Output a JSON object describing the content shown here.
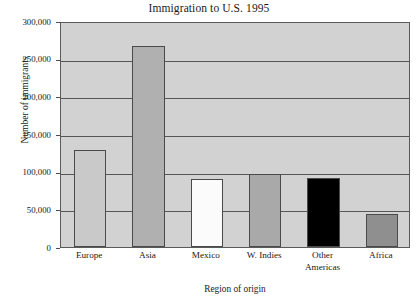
{
  "chart_data": {
    "type": "bar",
    "title": "Immigration to U.S. 1995",
    "xlabel": "Region of origin",
    "ylabel": "Number of immigrants",
    "categories": [
      "Europe",
      "Asia",
      "Mexico",
      "W. Indies",
      "Other Americas",
      "Africa"
    ],
    "values": [
      128500,
      267000,
      90000,
      97500,
      91500,
      43500
    ],
    "ylim": [
      0,
      300000
    ],
    "ytick_labels": [
      "0",
      "50,000",
      "100,000",
      "150,000",
      "200,000",
      "250,000",
      "300,000"
    ],
    "ytick_values": [
      0,
      50000,
      100000,
      150000,
      200000,
      250000,
      300000
    ],
    "grid": true,
    "legend": null,
    "bar_colors": [
      "#c9c9c9",
      "#b0b0b0",
      "#fbfbfb",
      "#a9a9a9",
      "#000000",
      "#8f8f8f"
    ],
    "plot_background": "#d2d2d2",
    "bar_edge_color": "#4a4a4a",
    "gridline_color": "#565656",
    "series": [
      {
        "name": "Immigrants 1995",
        "points": [
          {
            "category": "Europe",
            "value": 128500,
            "color": "#c9c9c9"
          },
          {
            "category": "Asia",
            "value": 267000,
            "color": "#b0b0b0"
          },
          {
            "category": "Mexico",
            "value": 90000,
            "color": "#fbfbfb"
          },
          {
            "category": "W. Indies",
            "value": 97500,
            "color": "#a9a9a9"
          },
          {
            "category": "Other Americas",
            "value": 91500,
            "color": "#000000"
          },
          {
            "category": "Africa",
            "value": 43500,
            "color": "#8f8f8f"
          }
        ]
      }
    ],
    "category_label_lines": [
      [
        "Europe"
      ],
      [
        "Asia"
      ],
      [
        "Mexico"
      ],
      [
        "W. Indies"
      ],
      [
        "Other",
        "Americas"
      ],
      [
        "Africa"
      ]
    ]
  }
}
